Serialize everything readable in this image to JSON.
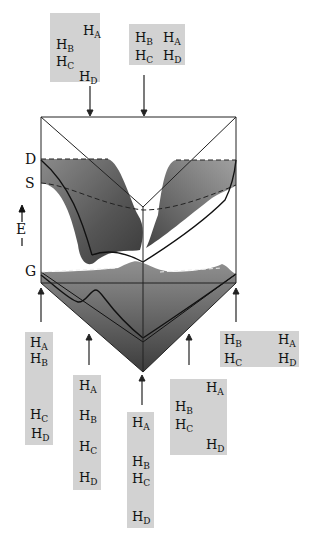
{
  "figure": {
    "type": "potential-energy-surface",
    "axis": {
      "energy_label": "E",
      "levels": [
        "D",
        "S",
        "G"
      ]
    },
    "configurations": {
      "top_left": {
        "atoms": [
          {
            "s": "A",
            "x": 83,
            "y": 24
          },
          {
            "s": "B",
            "x": 56,
            "y": 38
          },
          {
            "s": "C",
            "x": 56,
            "y": 55
          },
          {
            "s": "D",
            "x": 79,
            "y": 70
          }
        ]
      },
      "top_right": {
        "atoms": [
          {
            "s": "B",
            "x": 135,
            "y": 31
          },
          {
            "s": "A",
            "x": 163,
            "y": 31
          },
          {
            "s": "C",
            "x": 135,
            "y": 49
          },
          {
            "s": "D",
            "x": 163,
            "y": 49
          }
        ]
      },
      "bottom_far_left": {
        "atoms": [
          {
            "s": "A",
            "x": 30,
            "y": 336
          },
          {
            "s": "B",
            "x": 30,
            "y": 352
          },
          {
            "s": "C",
            "x": 30,
            "y": 408
          },
          {
            "s": "D",
            "x": 31,
            "y": 427
          }
        ]
      },
      "bottom_left": {
        "atoms": [
          {
            "s": "A",
            "x": 79,
            "y": 379
          },
          {
            "s": "B",
            "x": 79,
            "y": 409
          },
          {
            "s": "C",
            "x": 79,
            "y": 440
          },
          {
            "s": "D",
            "x": 79,
            "y": 471
          }
        ]
      },
      "bottom_center": {
        "atoms": [
          {
            "s": "A",
            "x": 132,
            "y": 416
          },
          {
            "s": "B",
            "x": 132,
            "y": 455
          },
          {
            "s": "C",
            "x": 132,
            "y": 472
          },
          {
            "s": "D",
            "x": 132,
            "y": 510
          }
        ]
      },
      "bottom_right": {
        "atoms": [
          {
            "s": "A",
            "x": 206,
            "y": 381
          },
          {
            "s": "B",
            "x": 175,
            "y": 400
          },
          {
            "s": "C",
            "x": 175,
            "y": 418
          },
          {
            "s": "D",
            "x": 206,
            "y": 438
          }
        ]
      },
      "right": {
        "atoms": [
          {
            "s": "B",
            "x": 224,
            "y": 333
          },
          {
            "s": "A",
            "x": 278,
            "y": 333
          },
          {
            "s": "C",
            "x": 224,
            "y": 352
          },
          {
            "s": "D",
            "x": 278,
            "y": 352
          }
        ]
      }
    },
    "atom_prefix": "H"
  }
}
